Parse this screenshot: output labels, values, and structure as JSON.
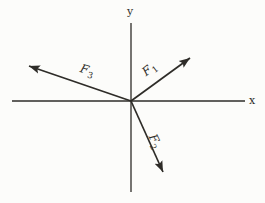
{
  "figure": {
    "type": "force-vector-diagram",
    "colors": {
      "ink": "#2e2c28",
      "paper": "#fcfcfa"
    },
    "axes": {
      "x_label": "x",
      "y_label": "y"
    },
    "vectors": [
      {
        "symbol": "F",
        "subscript": "1",
        "direction": "up-right from origin, first quadrant, about 36 degrees above x-axis"
      },
      {
        "symbol": "F",
        "subscript": "2",
        "direction": "down-right from origin, fourth quadrant, about 66 degrees below x-axis"
      },
      {
        "symbol": "F",
        "subscript": "3",
        "direction": "up-left from origin, second quadrant, about 19 degrees above negative x-axis"
      }
    ]
  }
}
